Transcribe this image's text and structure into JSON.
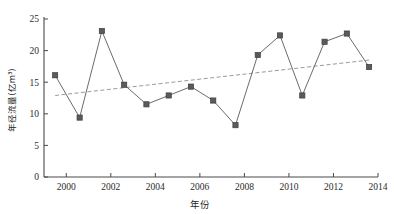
{
  "chart_data": {
    "type": "line",
    "title": "",
    "xlabel": "年份",
    "ylabel": "年径流量(亿m³)",
    "xlim": [
      1999,
      2014
    ],
    "ylim": [
      0,
      25
    ],
    "xticks": [
      2000,
      2002,
      2004,
      2006,
      2008,
      2010,
      2012,
      2014
    ],
    "yticks": [
      0,
      5,
      10,
      15,
      20,
      25
    ],
    "grid": false,
    "legend": "none",
    "x": [
      1999.5,
      2000.6,
      2001.6,
      2002.6,
      2003.6,
      2004.6,
      2005.6,
      2006.6,
      2007.6,
      2008.6,
      2009.6,
      2010.6,
      2011.6,
      2012.6,
      2013.6
    ],
    "values": [
      16.1,
      9.4,
      23.1,
      14.6,
      11.5,
      12.9,
      14.3,
      12.1,
      8.2,
      19.3,
      22.4,
      12.9,
      21.4,
      22.7,
      17.4
    ],
    "series": [
      {
        "name": "年径流量",
        "style": "line-with-square-markers",
        "color": "#6b6b6b",
        "marker_color": "#5a5a5a",
        "values": [
          16.1,
          9.4,
          23.1,
          14.6,
          11.5,
          12.9,
          14.3,
          12.1,
          8.2,
          19.3,
          22.4,
          12.9,
          21.4,
          22.7,
          17.4
        ]
      },
      {
        "name": "趋势线",
        "style": "dashed-trend-line",
        "color": "#9a9a9a",
        "x_start": 1999.5,
        "x_end": 2013.6,
        "y_start": 12.9,
        "y_end": 18.5
      }
    ],
    "annotations": []
  },
  "axis": {
    "y_tick_labels": [
      "0",
      "5",
      "10",
      "15",
      "20",
      "25"
    ],
    "x_tick_labels": [
      "2000",
      "2002",
      "2004",
      "2006",
      "2008",
      "2010",
      "2012",
      "2014"
    ],
    "x_title": "年份",
    "y_title": "年径流量(亿m³)"
  },
  "colors": {
    "series_line": "#6b6b6b",
    "marker": "#5a5a5a",
    "trend_line": "#9a9a9a",
    "axis": "#4a4a4a",
    "text": "#1f1f1f",
    "background": "#ffffff"
  }
}
